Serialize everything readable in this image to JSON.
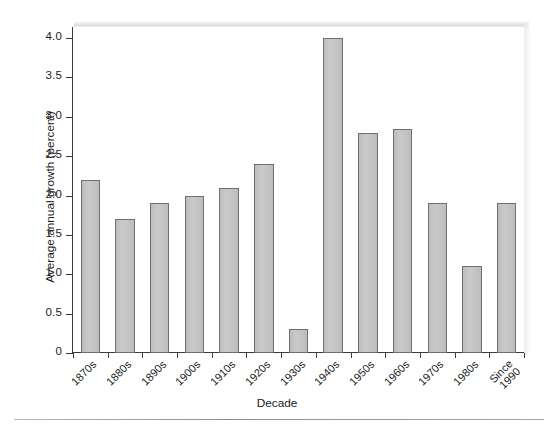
{
  "chart_data": {
    "type": "bar",
    "title": "",
    "xlabel": "Decade",
    "ylabel": "Average annual growth (percent)",
    "categories": [
      "1870s",
      "1880s",
      "1890s",
      "1900s",
      "1910s",
      "1920s",
      "1930s",
      "1940s",
      "1950s",
      "1960s",
      "1970s",
      "1980s",
      "Since 1990"
    ],
    "values": [
      2.2,
      1.7,
      1.9,
      2.0,
      2.1,
      2.4,
      0.3,
      4.0,
      2.8,
      2.85,
      1.9,
      1.1,
      1.9
    ],
    "ylim": [
      0,
      4.15
    ],
    "yticks": [
      0,
      0.5,
      1.0,
      1.5,
      2.0,
      2.5,
      3.0,
      3.5,
      4.0
    ],
    "ytick_labels": [
      "0",
      "0.5",
      "1.0",
      "1.5",
      "2.0",
      "2.5",
      "3.0",
      "3.5",
      "4.0"
    ],
    "grid": false,
    "legend": null,
    "bar_color": "#c2c2c2",
    "bar_edge_color": "#6f6f6f",
    "axis_color": "#3a3a3a",
    "xtick_rotation": -45
  }
}
